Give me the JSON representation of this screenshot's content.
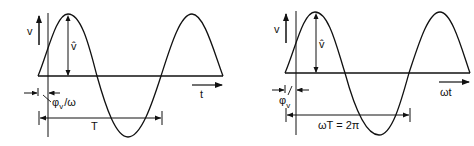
{
  "diagrams": [
    {
      "id": "time-domain",
      "y_axis_label": "v",
      "amplitude_label": "v̂",
      "x_axis_label": "t",
      "phase_label_main": "φ",
      "phase_label_sub": "v",
      "phase_label_tail": "/ω",
      "period_label": "T"
    },
    {
      "id": "angle-domain",
      "y_axis_label": "v",
      "amplitude_label": "v̂",
      "x_axis_label": "ωt",
      "phase_label_main": "φ",
      "phase_label_sub": "v",
      "period_label": "ωT = 2π"
    }
  ],
  "colors": {
    "ink": "#111111",
    "background": "#ffffff"
  }
}
